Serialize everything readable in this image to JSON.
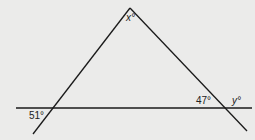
{
  "diagram": {
    "type": "geometry-triangle-with-transversal",
    "labels": {
      "apex": "x°",
      "bottom_left_exterior": "51°",
      "bottom_right_interior": "47°",
      "right_exterior": "y°"
    },
    "colors": {
      "background": "#ebebea",
      "line": "#1a1a1a",
      "text": "#222222"
    }
  }
}
